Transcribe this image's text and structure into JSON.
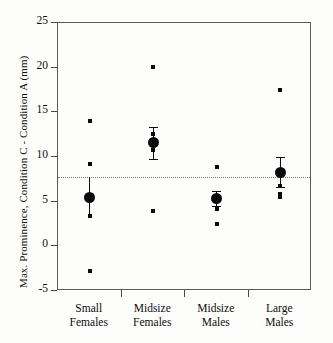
{
  "chart_data": {
    "type": "scatter",
    "title": "",
    "xlabel": "",
    "ylabel": "Max. Prominence, Condition C - Condition A (mm)",
    "ylim": [
      -5,
      25
    ],
    "yticks": [
      25,
      20,
      15,
      10,
      5,
      0,
      -5
    ],
    "ytick_labels": [
      "25",
      "20",
      "15",
      "10",
      "5",
      "0",
      "-5"
    ],
    "grid": false,
    "legend": "none",
    "reference_line": {
      "orientation": "horizontal",
      "value": 7.8,
      "style": "dotted",
      "label": ""
    },
    "categories": [
      "Small Females",
      "Midsize Females",
      "Midsize Males",
      "Large Males"
    ],
    "category_lines": [
      [
        "Small",
        "Females"
      ],
      [
        "Midsize",
        "Females"
      ],
      [
        "Midsize",
        "Males"
      ],
      [
        "Large",
        "Males"
      ]
    ],
    "groups": [
      {
        "name": "Small Females",
        "mean": 5.5,
        "error_low": 3.4,
        "error_high": 7.8,
        "points": [
          14.0,
          9.2,
          3.4,
          -2.8
        ]
      },
      {
        "name": "Midsize Females",
        "mean": 11.6,
        "error_low": 9.8,
        "error_high": 13.4,
        "points": [
          20.1,
          12.6,
          10.8,
          3.9
        ]
      },
      {
        "name": "Midsize Males",
        "mean": 5.4,
        "error_low": 4.5,
        "error_high": 6.2,
        "points": [
          8.9,
          4.2,
          2.5
        ]
      },
      {
        "name": "Large Males",
        "mean": 8.3,
        "error_low": 6.6,
        "error_high": 10.0,
        "points": [
          17.5,
          6.7,
          5.9,
          5.5
        ]
      }
    ],
    "colors": {
      "marker": "#0a0a0a",
      "axis": "#5a5a5a",
      "reference_line": "#7d7d7d",
      "background": "#fdfdfc"
    }
  }
}
